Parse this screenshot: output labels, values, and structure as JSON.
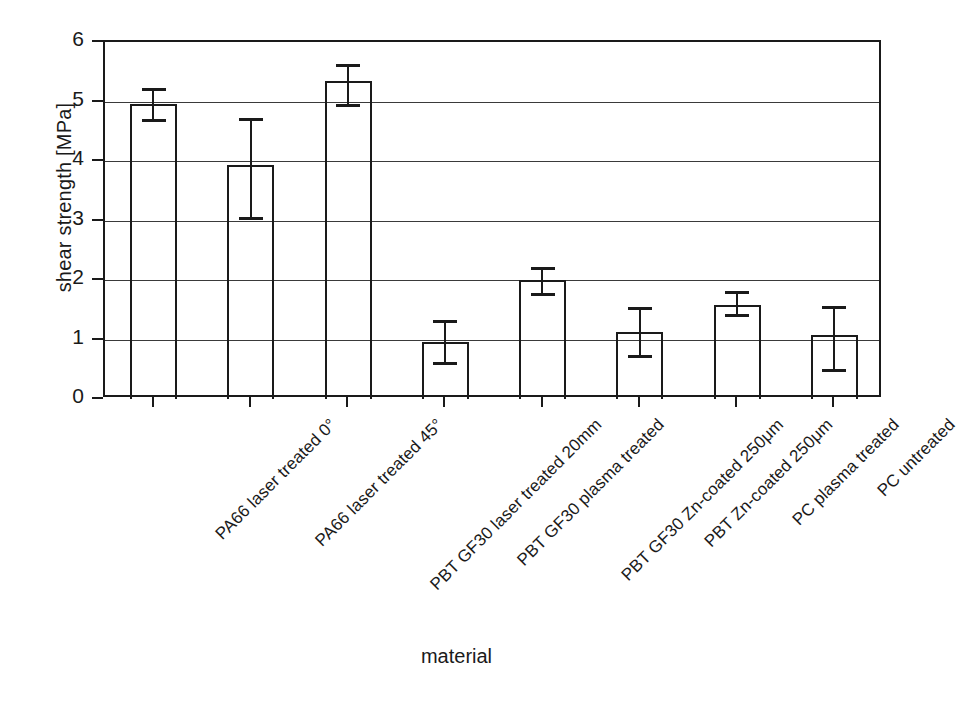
{
  "chart_data": {
    "type": "bar",
    "title": "",
    "subtitle": "",
    "xlabel": "material",
    "ylabel": "shear strength  [MPa]",
    "ylim": [
      0,
      6
    ],
    "yticks": [
      0,
      1,
      2,
      3,
      4,
      5,
      6
    ],
    "ytick_labels": [
      "0",
      "1",
      "2",
      "3",
      "4",
      "5",
      "6"
    ],
    "grid": true,
    "grid_axis": "y",
    "legend": null,
    "legend_position": "none",
    "bar_style": {
      "fill": "#ffffff",
      "edge_color": "#1a1a1a",
      "error_bar_color": "#1a1a1a"
    },
    "categories": [
      "PA66 laser treated 0°",
      "PA66 laser treated 45°",
      "PBT GF30 laser treated 20mm",
      "PBT GF30 plasma treated",
      "PBT GF30 Zn-coated 250μm",
      "PBT Zn-coated 250μm",
      "PC plasma treated",
      "PC untreated"
    ],
    "values": [
      4.95,
      3.93,
      5.34,
      0.96,
      2.0,
      1.13,
      1.58,
      1.08
    ],
    "error_low": [
      4.7,
      3.06,
      4.95,
      0.62,
      1.78,
      0.74,
      1.43,
      0.5
    ],
    "error_high": [
      5.22,
      4.73,
      5.63,
      1.33,
      2.22,
      1.55,
      1.82,
      1.57
    ]
  },
  "axis": {
    "y_title": "shear strength  [MPa]",
    "x_title": "material"
  }
}
